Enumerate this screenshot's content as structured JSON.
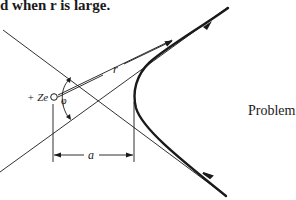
{
  "header": {
    "text": "d when r is large."
  },
  "figure": {
    "caption": "Problem 19.2",
    "labels": {
      "charge": "+ Ze",
      "distance": "r",
      "angle": "φ",
      "impact_parameter": "a"
    },
    "colors": {
      "ink": "#1a1a1a",
      "background": "#ffffff"
    }
  }
}
